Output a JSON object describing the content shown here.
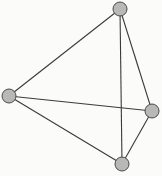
{
  "diagram": {
    "type": "graph",
    "colors": {
      "background": "#fbfbf9",
      "edge": "#3a3a3a",
      "node_fill": "#b8b8b8",
      "node_stroke": "#4a4a4a"
    },
    "node_radius": 7,
    "nodes": [
      {
        "id": "top",
        "x": 120,
        "y": 9
      },
      {
        "id": "left",
        "x": 9,
        "y": 96
      },
      {
        "id": "right",
        "x": 152,
        "y": 111
      },
      {
        "id": "bottom",
        "x": 122,
        "y": 164
      }
    ],
    "edges": [
      {
        "from": "top",
        "to": "left"
      },
      {
        "from": "top",
        "to": "right"
      },
      {
        "from": "top",
        "to": "bottom"
      },
      {
        "from": "left",
        "to": "right"
      },
      {
        "from": "left",
        "to": "bottom"
      },
      {
        "from": "right",
        "to": "bottom"
      }
    ]
  }
}
